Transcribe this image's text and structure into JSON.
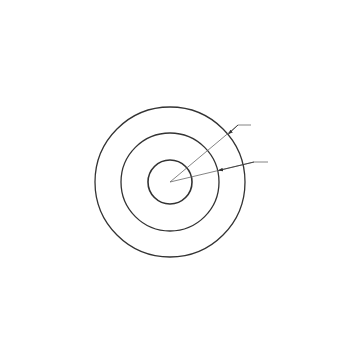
{
  "diagram": {
    "labels": {
      "top_load": "p",
      "bottom_load": "p",
      "left_load": "q",
      "right_load": "q",
      "zone_1": "I",
      "zone_2": "II",
      "zone_3": "III",
      "inner_pressure": "q",
      "inner_pressure_sub": "0",
      "inner_radius": "r",
      "inner_radius_sub": "0",
      "outer_radius_a": "a",
      "outer_radius_b": "b"
    },
    "center": [
      170,
      182
    ],
    "radii": {
      "outer": 75,
      "middle": 49,
      "inner": 22
    },
    "top_arrows_x": [
      57,
      79,
      102,
      124,
      147,
      170,
      192,
      215,
      237,
      260,
      283
    ],
    "bottom_arrows_x": [
      59,
      81,
      104,
      126,
      149,
      171,
      194,
      216,
      239,
      261,
      284
    ],
    "side_arrows_y": [
      101,
      124,
      147,
      170,
      193,
      217,
      239,
      263
    ],
    "stroke_color": "#333333"
  }
}
